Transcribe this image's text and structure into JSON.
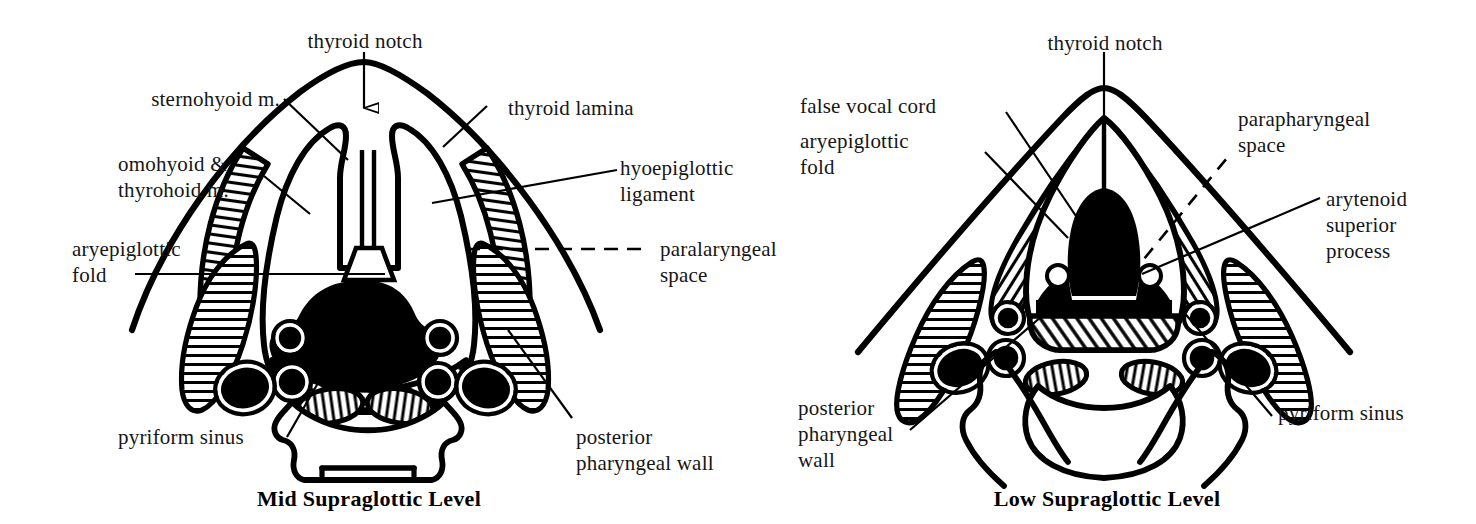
{
  "figure": {
    "type": "anatomical-diagram",
    "background_color": "#ffffff",
    "ink_color": "#000000"
  },
  "panels": [
    {
      "id": "mid-supraglottic",
      "title": "Mid Supraglottic Level",
      "labels": [
        {
          "key": "thyroid-notch",
          "lines": [
            "thyroid notch"
          ],
          "leader": "arrow-down-hollow"
        },
        {
          "key": "sternohyoid-m",
          "lines": [
            "sternohyoid m."
          ],
          "leader": "line"
        },
        {
          "key": "omohyoid-thyrohoid-m",
          "lines": [
            "omohyoid &",
            "thyrohoid m."
          ],
          "leader": "line"
        },
        {
          "key": "aryepiglottic-fold",
          "lines": [
            "aryepiglottic",
            "fold"
          ],
          "leader": "line"
        },
        {
          "key": "pyriform-sinus",
          "lines": [
            "pyriform sinus"
          ],
          "leader": "line"
        },
        {
          "key": "thyroid-lamina",
          "lines": [
            "thyroid lamina"
          ],
          "leader": "line"
        },
        {
          "key": "hyoepiglottic-ligament",
          "lines": [
            "hyoepiglottic",
            "ligament"
          ],
          "leader": "line"
        },
        {
          "key": "paralaryngeal-space",
          "lines": [
            "paralaryngeal",
            "space"
          ],
          "leader": "dashed"
        },
        {
          "key": "posterior-pharyngeal-wall",
          "lines": [
            "posterior",
            "pharyngeal wall"
          ],
          "leader": "line"
        }
      ]
    },
    {
      "id": "low-supraglottic",
      "title": "Low Supraglottic Level",
      "labels": [
        {
          "key": "thyroid-notch",
          "lines": [
            "thyroid  notch"
          ],
          "leader": "line"
        },
        {
          "key": "false-vocal-cord",
          "lines": [
            "false vocal cord"
          ],
          "leader": "line"
        },
        {
          "key": "aryepiglottic-fold",
          "lines": [
            "aryepiglottic",
            "fold"
          ],
          "leader": "line"
        },
        {
          "key": "parapharyngeal-space",
          "lines": [
            "parapharyngeal",
            "space"
          ],
          "leader": "dashed"
        },
        {
          "key": "arytenoid-superior-process",
          "lines": [
            "arytenoid",
            "superior",
            "process"
          ],
          "leader": "line"
        },
        {
          "key": "posterior-pharyngeal-wall",
          "lines": [
            "posterior",
            "pharyngeal",
            "wall"
          ],
          "leader": "line"
        },
        {
          "key": "pyriform-sinus",
          "lines": [
            "pyriform sinus"
          ],
          "leader": "line"
        }
      ]
    }
  ]
}
